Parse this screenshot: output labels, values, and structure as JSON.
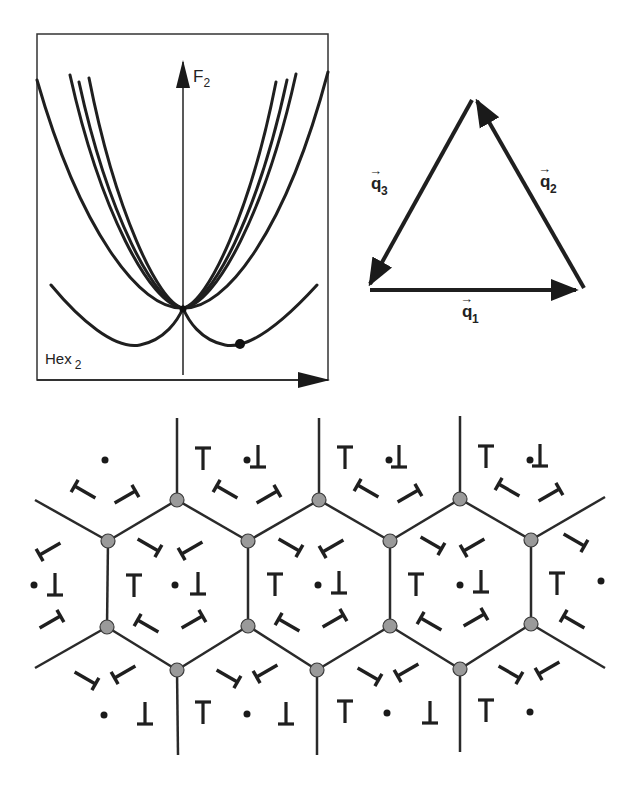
{
  "energy_plot": {
    "y_axis_label": "F",
    "y_axis_subscript": "2",
    "phase_label": "Hex",
    "phase_subscript": "2",
    "box": {
      "x": 37,
      "y": 34,
      "w": 291,
      "h": 346
    },
    "origin": {
      "x": 183,
      "y": 310
    },
    "curves_count": 7,
    "marked_point": {
      "x": 240,
      "y": 344
    }
  },
  "wavevector_triangle": {
    "vectors": [
      {
        "name": "q",
        "subscript": "1",
        "from": [
          368,
          290
        ],
        "to": [
          582,
          290
        ],
        "label_pos": [
          468,
          320
        ]
      },
      {
        "name": "q",
        "subscript": "2",
        "from": [
          582,
          290
        ],
        "to": [
          474,
          96
        ],
        "label_pos": [
          545,
          188
        ]
      },
      {
        "name": "q",
        "subscript": "3",
        "from": [
          474,
          96
        ],
        "to": [
          368,
          290
        ],
        "label_pos": [
          373,
          190
        ]
      }
    ]
  },
  "lattice": {
    "node_color": "#9a9a9a",
    "line_color": "#2a2a2a",
    "nodes": [
      [
        177,
        500
      ],
      [
        319,
        500
      ],
      [
        460,
        499
      ],
      [
        108,
        541
      ],
      [
        248,
        541
      ],
      [
        390,
        541
      ],
      [
        531,
        540
      ],
      [
        107,
        627
      ],
      [
        248,
        626
      ],
      [
        390,
        626
      ],
      [
        531,
        624
      ],
      [
        177,
        670
      ],
      [
        317,
        670
      ],
      [
        460,
        669
      ]
    ],
    "edges": [
      [
        108,
        541,
        177,
        500
      ],
      [
        177,
        500,
        248,
        541
      ],
      [
        248,
        541,
        319,
        500
      ],
      [
        319,
        500,
        390,
        541
      ],
      [
        390,
        541,
        460,
        499
      ],
      [
        460,
        499,
        531,
        540
      ],
      [
        107,
        627,
        177,
        670
      ],
      [
        177,
        670,
        248,
        626
      ],
      [
        248,
        626,
        317,
        670
      ],
      [
        317,
        670,
        390,
        626
      ],
      [
        390,
        626,
        460,
        669
      ],
      [
        460,
        669,
        531,
        624
      ],
      [
        108,
        541,
        107,
        627
      ],
      [
        248,
        541,
        248,
        626
      ],
      [
        390,
        541,
        390,
        626
      ],
      [
        531,
        540,
        531,
        624
      ],
      [
        177,
        500,
        177,
        418
      ],
      [
        319,
        500,
        319,
        418
      ],
      [
        460,
        499,
        460,
        416
      ],
      [
        177,
        670,
        178,
        755
      ],
      [
        317,
        670,
        317,
        755
      ],
      [
        460,
        669,
        460,
        752
      ],
      [
        108,
        541,
        35,
        500
      ],
      [
        531,
        540,
        605,
        497
      ],
      [
        107,
        627,
        35,
        668
      ],
      [
        531,
        624,
        605,
        668
      ]
    ],
    "dots": [
      [
        105,
        460
      ],
      [
        247,
        460
      ],
      [
        389,
        460
      ],
      [
        530,
        460
      ],
      [
        34,
        585
      ],
      [
        175,
        585
      ],
      [
        318,
        585
      ],
      [
        460,
        585
      ],
      [
        601,
        581
      ],
      [
        104,
        715
      ],
      [
        247,
        714
      ],
      [
        387,
        713
      ],
      [
        530,
        712
      ]
    ],
    "tee_up": [
      [
        203,
        459
      ],
      [
        345,
        458
      ],
      [
        486,
        457
      ],
      [
        134,
        586
      ],
      [
        275,
        585
      ],
      [
        416,
        585
      ],
      [
        557,
        584
      ],
      [
        203,
        713
      ],
      [
        345,
        712
      ],
      [
        486,
        711
      ]
    ],
    "tee_down": [
      [
        258,
        456
      ],
      [
        399,
        456
      ],
      [
        540,
        455
      ],
      [
        55,
        584
      ],
      [
        198,
        583
      ],
      [
        339,
        582
      ],
      [
        481,
        581
      ],
      [
        145,
        713
      ],
      [
        286,
        713
      ],
      [
        430,
        712
      ]
    ],
    "tilted_tees": [
      [
        85,
        492,
        -150
      ],
      [
        125,
        497,
        -30
      ],
      [
        227,
        492,
        -150
      ],
      [
        267,
        497,
        -30
      ],
      [
        368,
        491,
        -150
      ],
      [
        408,
        496,
        -30
      ],
      [
        509,
        490,
        -150
      ],
      [
        549,
        495,
        -30
      ],
      [
        50,
        549,
        150
      ],
      [
        148,
        545,
        30
      ],
      [
        192,
        548,
        150
      ],
      [
        289,
        545,
        30
      ],
      [
        333,
        546,
        150
      ],
      [
        431,
        543,
        30
      ],
      [
        474,
        545,
        150
      ],
      [
        574,
        540,
        30
      ],
      [
        50,
        622,
        -30
      ],
      [
        148,
        626,
        -150
      ],
      [
        192,
        622,
        -30
      ],
      [
        289,
        625,
        -150
      ],
      [
        333,
        621,
        -30
      ],
      [
        431,
        624,
        -150
      ],
      [
        474,
        620,
        -30
      ],
      [
        574,
        622,
        -150
      ],
      [
        85,
        678,
        30
      ],
      [
        125,
        672,
        150
      ],
      [
        227,
        676,
        30
      ],
      [
        267,
        671,
        150
      ],
      [
        368,
        674,
        30
      ],
      [
        408,
        670,
        150
      ],
      [
        509,
        672,
        30
      ],
      [
        549,
        668,
        150
      ]
    ]
  }
}
